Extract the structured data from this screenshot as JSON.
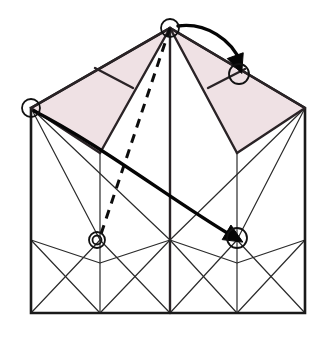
{
  "document": {
    "title": "Origami folding step diagram",
    "type": "line-drawing",
    "width": 320,
    "height": 342,
    "background_color": "#ffffff"
  },
  "colors": {
    "outline": "#1a1a1a",
    "thin_line": "#2b2b2b",
    "shade_fill": "#efe1e4",
    "shade_stroke": "#2a2326",
    "arrow": "#050505",
    "dashed": "#0d0d0d",
    "marker_stroke": "#111111",
    "marker_fill": "none"
  },
  "stroke_widths": {
    "outline": 2.6,
    "shade_edge": 2.4,
    "thin": 1.2,
    "bottom_thin": 1.3,
    "arrow": 3.4,
    "dashed": 3.0,
    "marker": 1.8
  },
  "geometry": {
    "points": {
      "apex": [
        170,
        28
      ],
      "left_top": [
        31,
        108
      ],
      "right_top": [
        305,
        108
      ],
      "left_fold_base": [
        100,
        153
      ],
      "right_fold_base": [
        237,
        153
      ],
      "left_bottom": [
        31,
        313
      ],
      "right_bottom": [
        305,
        313
      ],
      "mid_bottom": [
        170,
        313
      ],
      "left_band": [
        31,
        240
      ],
      "mid_band": [
        170,
        240
      ],
      "right_band": [
        305,
        240
      ],
      "left_col_band": [
        100,
        240
      ],
      "right_col_band": [
        237,
        240
      ],
      "shade_crease_left_a": [
        95,
        68
      ],
      "shade_crease_left_b": [
        133,
        88
      ],
      "shade_crease_right_a": [
        208,
        88
      ],
      "shade_crease_right_b": [
        245,
        69
      ]
    },
    "shaded_panels": [
      {
        "name": "left-shaded-flap",
        "polygon": "170,28 31,108 100,153 170,28"
      },
      {
        "name": "right-shaded-flap",
        "polygon": "170,28 305,108 237,153 170,28"
      }
    ],
    "outline_path": "31,108 31,313 305,313 305,108 170,28 31,108",
    "fold_lines": [
      {
        "name": "apex-to-left-fold-base",
        "from": [
          170,
          28
        ],
        "to": [
          100,
          153
        ]
      },
      {
        "name": "apex-to-right-fold-base",
        "from": [
          170,
          28
        ],
        "to": [
          237,
          153
        ]
      },
      {
        "name": "apex-center-vertical",
        "from": [
          170,
          28
        ],
        "to": [
          170,
          313
        ]
      },
      {
        "name": "left-column-vertical",
        "from": [
          100,
          153
        ],
        "to": [
          100,
          313
        ]
      },
      {
        "name": "right-column-vertical",
        "from": [
          237,
          153
        ],
        "to": [
          237,
          313
        ]
      },
      {
        "name": "left-crease-in-shade",
        "from": [
          95,
          68
        ],
        "to": [
          133,
          88
        ]
      },
      {
        "name": "right-crease-in-shade",
        "from": [
          208,
          88
        ],
        "to": [
          245,
          69
        ]
      },
      {
        "name": "left-vertex-to-left-column-base",
        "from": [
          31,
          108
        ],
        "to": [
          100,
          240
        ]
      },
      {
        "name": "left-vertex-to-mid-bottom",
        "from": [
          31,
          108
        ],
        "to": [
          170,
          240
        ]
      },
      {
        "name": "right-vertex-to-right-column-base",
        "from": [
          305,
          108
        ],
        "to": [
          237,
          240
        ]
      },
      {
        "name": "right-vertex-to-mid-bottom",
        "from": [
          305,
          108
        ],
        "to": [
          170,
          240
        ]
      },
      {
        "name": "band-zigzag",
        "polyline": "31,240 100,263 170,240 237,263 305,240"
      },
      {
        "name": "bottom-x-left-a",
        "from": [
          31,
          240
        ],
        "to": [
          100,
          313
        ]
      },
      {
        "name": "bottom-x-left-b",
        "from": [
          100,
          240
        ],
        "to": [
          31,
          313
        ]
      },
      {
        "name": "bottom-x-left-c",
        "from": [
          100,
          240
        ],
        "to": [
          170,
          313
        ]
      },
      {
        "name": "bottom-x-left-d",
        "from": [
          170,
          240
        ],
        "to": [
          100,
          313
        ]
      },
      {
        "name": "bottom-x-right-a",
        "from": [
          170,
          240
        ],
        "to": [
          237,
          313
        ]
      },
      {
        "name": "bottom-x-right-b",
        "from": [
          237,
          240
        ],
        "to": [
          170,
          313
        ]
      },
      {
        "name": "bottom-x-right-c",
        "from": [
          237,
          240
        ],
        "to": [
          305,
          313
        ]
      },
      {
        "name": "bottom-x-right-d",
        "from": [
          305,
          240
        ],
        "to": [
          237,
          313
        ]
      }
    ],
    "dashed_line": {
      "name": "hidden-fold-apex-to-left-pivot",
      "from": [
        170,
        28
      ],
      "to": [
        99,
        240
      ],
      "dash_pattern": "9 7"
    },
    "arrows": [
      {
        "name": "top-fold-arrow",
        "path": "M 178,26 C 206,22 232,40 241,63",
        "head_at": [
          239,
          66
        ],
        "head_angle": 70
      },
      {
        "name": "main-fold-arrow",
        "path": "M 34,111 C 96,142 172,200 229,234",
        "head_at": [
          236,
          238
        ],
        "head_angle": 31
      }
    ],
    "markers": [
      {
        "name": "apex-marker",
        "cx": 170,
        "cy": 28,
        "r": 9,
        "double": false
      },
      {
        "name": "left-vertex-marker",
        "cx": 31,
        "cy": 108,
        "r": 9,
        "double": false
      },
      {
        "name": "right-target-marker",
        "cx": 239,
        "cy": 74,
        "r": 10,
        "double": false
      },
      {
        "name": "left-pivot-marker",
        "cx": 97,
        "cy": 240,
        "r": 8,
        "double": true,
        "r_inner": 4.5
      },
      {
        "name": "right-target-lower-marker",
        "cx": 237,
        "cy": 238,
        "r": 10,
        "double": false
      }
    ]
  },
  "labels": {
    "none_visible": ""
  }
}
